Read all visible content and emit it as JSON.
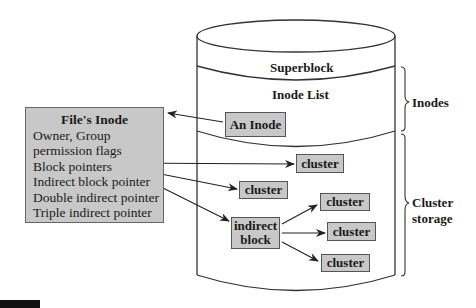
{
  "diagram": {
    "type": "file-system-inode-structure",
    "disk": {
      "sections": [
        {
          "id": "superblock",
          "label": "Superblock"
        },
        {
          "id": "inode-list",
          "label": "Inode List"
        }
      ],
      "an_inode_label": "An Inode",
      "indirect_block_label_line1": "indirect",
      "indirect_block_label_line2": "block",
      "clusters": [
        {
          "id": "cluster-1",
          "label": "cluster"
        },
        {
          "id": "cluster-2",
          "label": "cluster"
        },
        {
          "id": "cluster-3",
          "label": "cluster"
        },
        {
          "id": "cluster-4",
          "label": "cluster"
        },
        {
          "id": "cluster-5",
          "label": "cluster"
        }
      ]
    },
    "file_inode": {
      "title": "File's Inode",
      "fields": [
        "Owner, Group",
        "permission flags",
        "Block pointers",
        "Indirect block pointer",
        "Double indirect pointer",
        "Triple indirect pointer"
      ]
    },
    "braces": [
      {
        "id": "inodes",
        "label_line1": "Inodes",
        "label_line2": ""
      },
      {
        "id": "cluster-storage",
        "label_line1": "Cluster",
        "label_line2": "storage"
      }
    ],
    "arrows": [
      {
        "from": "An Inode",
        "to": "File's Inode"
      },
      {
        "from": "Block pointers",
        "to": "cluster-1"
      },
      {
        "from": "Block pointers",
        "to": "cluster-2"
      },
      {
        "from": "Indirect block pointer",
        "to": "indirect block"
      },
      {
        "from": "indirect block",
        "to": "cluster-3"
      },
      {
        "from": "indirect block",
        "to": "cluster-4"
      },
      {
        "from": "indirect block",
        "to": "cluster-5"
      }
    ],
    "colors": {
      "box_fill": "#c8c8c8",
      "stroke": "#333333",
      "background": "#ffffff"
    }
  }
}
